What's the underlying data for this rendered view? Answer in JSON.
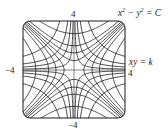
{
  "diagram": {
    "type": "orthogonal-trajectories",
    "families": [
      {
        "name": "hyperbola-family-1",
        "equation": "x^2 - y^2 = C",
        "values": [
          -9,
          -4,
          -2,
          -0.6,
          0.6,
          2,
          4,
          9
        ]
      },
      {
        "name": "hyperbola-family-2",
        "equation": "xy = k",
        "values": [
          -4.5,
          -2,
          -1,
          -0.3,
          0.3,
          1,
          2,
          4.5
        ]
      }
    ],
    "xlim": [
      -4,
      4
    ],
    "ylim": [
      -4,
      4
    ],
    "stroke_color": "#1a1a1a"
  },
  "labels": {
    "x_max": "4",
    "x_min": "−4",
    "y_max": "4",
    "y_min": "−4",
    "family1_eq_lhs": "x",
    "family1_eq_mid": " − y",
    "family1_eq_rhs": " = C",
    "sup2": "2",
    "family2_eq": "xy = k"
  }
}
